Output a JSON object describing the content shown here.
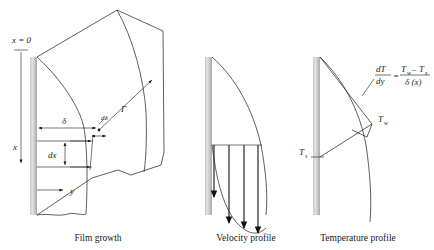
{
  "figure": {
    "background_color": "#ffffff",
    "line_color": "#1a1a1a",
    "wall_color_light": "#d8d8d8",
    "wall_color_dark": "#a8a8a8"
  },
  "panels": [
    {
      "id": "film-growth",
      "caption": "Film growth",
      "labels": {
        "origin": "x = 0",
        "axis_x": "x",
        "axis_y": "y",
        "film_thickness": "δ",
        "thickness_increment": "dδ",
        "element_height": "dx",
        "flow_rate": "Γ"
      }
    },
    {
      "id": "velocity-profile",
      "caption": "Velocity profile",
      "arrow_count": 4,
      "arrow_lengths_px": [
        52,
        78,
        94,
        104
      ]
    },
    {
      "id": "temperature-profile",
      "caption": "Temperature profile",
      "labels": {
        "wall_temp": "T",
        "wall_temp_sub": "w",
        "sat_temp": "T",
        "sat_temp_sub": "s",
        "equation_lhs_num": "dT",
        "equation_lhs_den": "dy",
        "equation_equals": "=",
        "equation_rhs_num_a": "T",
        "equation_rhs_num_a_sub": "w",
        "equation_rhs_num_minus": "–",
        "equation_rhs_num_b": "T",
        "equation_rhs_num_b_sub": "s",
        "equation_rhs_den": "δ (x)"
      }
    }
  ]
}
